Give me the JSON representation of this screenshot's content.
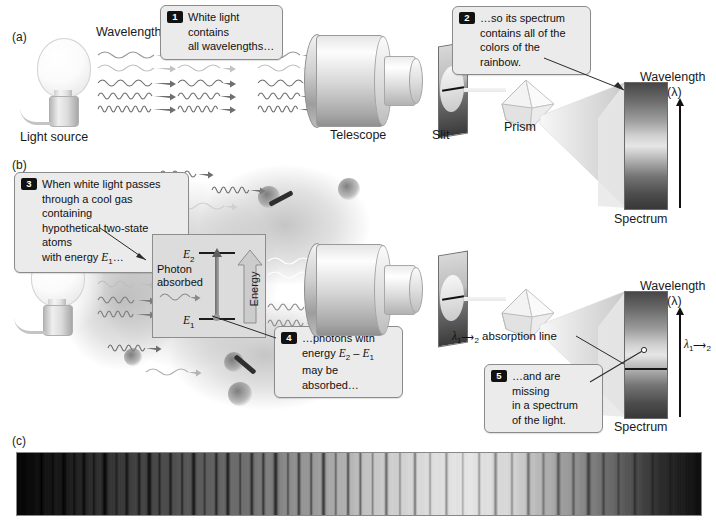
{
  "figure": {
    "panels": [
      {
        "id": "a",
        "label": "(a)"
      },
      {
        "id": "b",
        "label": "(b)"
      },
      {
        "id": "c",
        "label": "(c)"
      }
    ]
  },
  "panel_a": {
    "letter": "(a)",
    "light_source_label": "Light source",
    "wavelengths_label": "Wavelengths",
    "telescope_label": "Telescope",
    "slit_label": "Slit",
    "prism_label": "Prism",
    "spectrum_label": "Spectrum",
    "wavelength_axis_label": "Wavelength",
    "wavelength_axis_symbol": "(λ)",
    "callout": {
      "number": "1",
      "text": "White light contains\nall wavelengths…"
    },
    "callout2": {
      "number": "2",
      "text": "…so its spectrum\ncontains all of the\ncolors of the rainbow."
    },
    "wave_rows": 5
  },
  "panel_b": {
    "letter": "(b)",
    "spectrum_label": "Spectrum",
    "wavelength_axis_label": "Wavelength",
    "wavelength_axis_symbol": "(λ)",
    "absorption_line_label": "absorption line",
    "absorption_line_lambda": "λ",
    "absorption_line_sub": "1",
    "absorption_line_sub2": "2",
    "axis_line_marker": "λ",
    "callout3": {
      "number": "3",
      "text_line1": "When white light passes",
      "text_line2": "through a cool gas containing",
      "text_line3": "hypothetical two-state atoms",
      "text_line4_pre": "with energy ",
      "text_line4_sym": "E",
      "text_line4_sub": "1",
      "text_line4_post": "…"
    },
    "callout4": {
      "number": "4",
      "line1": "…photons with",
      "line2_pre": "energy ",
      "line2_e2": "E",
      "line2_sub2": "2",
      "line2_minus": " – ",
      "line2_e1": "E",
      "line2_sub1": "1",
      "line3": "may be absorbed…"
    },
    "callout5": {
      "number": "5",
      "text": "…and are missing\nin a spectrum\nof the light."
    },
    "energy_box": {
      "upper_level": "E",
      "upper_sub": "2",
      "lower_level": "E",
      "lower_sub": "1",
      "photon_label_line1": "Photon",
      "photon_label_line2": "absorbed",
      "energy_arrow_label": "Energy"
    }
  },
  "panel_c": {
    "letter": "(c)"
  },
  "colors": {
    "background": "#ffffff",
    "callout_fill": "#ebebeb",
    "callout_border": "#8b8b8b",
    "badge_bg": "#111111",
    "badge_fg": "#ffffff",
    "text": "#111111",
    "metal_light": "#f4f4f4",
    "metal_dark": "#8f8f8f",
    "absorption_line": "#1a1a1a",
    "energy_box_fill": "#dcdcdc"
  },
  "chart_data": {
    "type": "heatmap",
    "xlabel": "Wavelength",
    "ylabel": "",
    "continuum_stops": [
      {
        "pos": 0.0,
        "level": 0.02
      },
      {
        "pos": 0.06,
        "level": 0.1
      },
      {
        "pos": 0.14,
        "level": 0.22
      },
      {
        "pos": 0.24,
        "level": 0.33
      },
      {
        "pos": 0.34,
        "level": 0.45
      },
      {
        "pos": 0.44,
        "level": 0.62
      },
      {
        "pos": 0.52,
        "level": 0.78
      },
      {
        "pos": 0.6,
        "level": 0.86
      },
      {
        "pos": 0.66,
        "level": 0.9
      },
      {
        "pos": 0.72,
        "level": 0.84
      },
      {
        "pos": 0.8,
        "level": 0.62
      },
      {
        "pos": 0.88,
        "level": 0.38
      },
      {
        "pos": 0.94,
        "level": 0.18
      },
      {
        "pos": 1.0,
        "level": 0.06
      }
    ],
    "absorption_lines": [
      {
        "pos": 0.035,
        "depth": 0.75,
        "width": 1.2
      },
      {
        "pos": 0.052,
        "depth": 0.6,
        "width": 0.8
      },
      {
        "pos": 0.068,
        "depth": 0.85,
        "width": 1.6
      },
      {
        "pos": 0.083,
        "depth": 0.55,
        "width": 1.0
      },
      {
        "pos": 0.097,
        "depth": 0.7,
        "width": 1.3
      },
      {
        "pos": 0.112,
        "depth": 0.5,
        "width": 0.8
      },
      {
        "pos": 0.128,
        "depth": 0.8,
        "width": 1.8
      },
      {
        "pos": 0.145,
        "depth": 0.45,
        "width": 0.9
      },
      {
        "pos": 0.16,
        "depth": 0.65,
        "width": 1.2
      },
      {
        "pos": 0.178,
        "depth": 0.55,
        "width": 1.0
      },
      {
        "pos": 0.193,
        "depth": 0.75,
        "width": 1.5
      },
      {
        "pos": 0.208,
        "depth": 0.5,
        "width": 0.9
      },
      {
        "pos": 0.224,
        "depth": 0.62,
        "width": 1.1
      },
      {
        "pos": 0.241,
        "depth": 0.48,
        "width": 0.8
      },
      {
        "pos": 0.258,
        "depth": 0.7,
        "width": 1.4
      },
      {
        "pos": 0.274,
        "depth": 0.42,
        "width": 0.9
      },
      {
        "pos": 0.291,
        "depth": 0.58,
        "width": 1.1
      },
      {
        "pos": 0.308,
        "depth": 0.66,
        "width": 1.3
      },
      {
        "pos": 0.326,
        "depth": 0.44,
        "width": 0.8
      },
      {
        "pos": 0.343,
        "depth": 0.6,
        "width": 1.2
      },
      {
        "pos": 0.36,
        "depth": 0.52,
        "width": 1.0
      },
      {
        "pos": 0.378,
        "depth": 0.68,
        "width": 1.5
      },
      {
        "pos": 0.396,
        "depth": 0.4,
        "width": 0.8
      },
      {
        "pos": 0.412,
        "depth": 0.56,
        "width": 1.1
      },
      {
        "pos": 0.43,
        "depth": 0.48,
        "width": 0.9
      },
      {
        "pos": 0.448,
        "depth": 0.62,
        "width": 1.3
      },
      {
        "pos": 0.466,
        "depth": 0.38,
        "width": 0.8
      },
      {
        "pos": 0.484,
        "depth": 0.52,
        "width": 1.0
      },
      {
        "pos": 0.502,
        "depth": 0.44,
        "width": 0.9
      },
      {
        "pos": 0.52,
        "depth": 0.34,
        "width": 0.8
      },
      {
        "pos": 0.54,
        "depth": 0.46,
        "width": 1.1
      },
      {
        "pos": 0.56,
        "depth": 0.3,
        "width": 0.8
      },
      {
        "pos": 0.582,
        "depth": 0.4,
        "width": 1.0
      },
      {
        "pos": 0.604,
        "depth": 0.26,
        "width": 0.8
      },
      {
        "pos": 0.628,
        "depth": 0.34,
        "width": 1.0
      },
      {
        "pos": 0.652,
        "depth": 0.24,
        "width": 0.8
      },
      {
        "pos": 0.676,
        "depth": 0.3,
        "width": 0.9
      },
      {
        "pos": 0.7,
        "depth": 0.38,
        "width": 1.2
      },
      {
        "pos": 0.724,
        "depth": 0.28,
        "width": 0.9
      },
      {
        "pos": 0.748,
        "depth": 0.4,
        "width": 1.2
      },
      {
        "pos": 0.77,
        "depth": 0.32,
        "width": 1.0
      },
      {
        "pos": 0.792,
        "depth": 0.46,
        "width": 1.3
      },
      {
        "pos": 0.814,
        "depth": 0.36,
        "width": 1.0
      },
      {
        "pos": 0.836,
        "depth": 0.5,
        "width": 1.4
      },
      {
        "pos": 0.858,
        "depth": 0.4,
        "width": 1.1
      },
      {
        "pos": 0.88,
        "depth": 0.3,
        "width": 0.9
      },
      {
        "pos": 0.904,
        "depth": 0.36,
        "width": 1.0
      },
      {
        "pos": 0.93,
        "depth": 0.26,
        "width": 0.9
      },
      {
        "pos": 0.956,
        "depth": 0.2,
        "width": 0.8
      }
    ]
  },
  "spectrum_a": {
    "stops": [
      {
        "pos": 0.0,
        "level": 0.28
      },
      {
        "pos": 0.14,
        "level": 0.42
      },
      {
        "pos": 0.3,
        "level": 0.62
      },
      {
        "pos": 0.42,
        "level": 0.82
      },
      {
        "pos": 0.5,
        "level": 0.9
      },
      {
        "pos": 0.6,
        "level": 0.72
      },
      {
        "pos": 0.74,
        "level": 0.46
      },
      {
        "pos": 0.88,
        "level": 0.3
      },
      {
        "pos": 1.0,
        "level": 0.22
      }
    ]
  },
  "spectrum_b": {
    "absorption_line_position": 0.6,
    "stops": [
      {
        "pos": 0.0,
        "level": 0.28
      },
      {
        "pos": 0.14,
        "level": 0.42
      },
      {
        "pos": 0.3,
        "level": 0.62
      },
      {
        "pos": 0.42,
        "level": 0.82
      },
      {
        "pos": 0.5,
        "level": 0.9
      },
      {
        "pos": 0.6,
        "level": 0.72
      },
      {
        "pos": 0.74,
        "level": 0.46
      },
      {
        "pos": 0.88,
        "level": 0.3
      },
      {
        "pos": 1.0,
        "level": 0.22
      }
    ]
  }
}
